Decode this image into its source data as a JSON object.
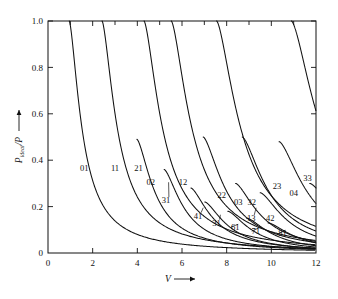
{
  "chart_data": {
    "type": "line",
    "title": "",
    "xlabel": "V",
    "ylabel": "P_ideal/P",
    "xlabel_display": "V",
    "ylabel_main": "P",
    "ylabel_sub": "ideal",
    "ylabel_den": "/P",
    "xlim": [
      0,
      12
    ],
    "ylim": [
      0,
      1.0
    ],
    "grid": false,
    "legend": "none",
    "x_ticks": [
      0,
      2,
      4,
      6,
      8,
      10,
      12
    ],
    "x_tick_labels": [
      "0",
      "2",
      "4",
      "6",
      "8",
      "10",
      "12"
    ],
    "x_minor_ticks": [
      1,
      3,
      5,
      7,
      9,
      11
    ],
    "y_ticks": [
      0,
      0.2,
      0.4,
      0.6,
      0.8,
      1.0
    ],
    "y_tick_labels": [
      "0",
      "0.2",
      "0.4",
      "0.6",
      "0.8",
      "1.0"
    ],
    "arrow_on_x_axis": true,
    "arrow_on_y_axis": true,
    "series": [
      {
        "name": "01",
        "cutoff": 0.0,
        "asymptote": 0.95,
        "label_x": 1.62,
        "label_y": 0.355,
        "leader": false
      },
      {
        "name": "11",
        "cutoff": 1.0,
        "asymptote": 2.42,
        "label_x": 3.0,
        "label_y": 0.355,
        "leader": false
      },
      {
        "name": "21",
        "cutoff": 0.49,
        "asymptote": 3.98,
        "label_x": 4.05,
        "label_y": 0.355,
        "leader": false
      },
      {
        "name": "02",
        "cutoff": 1.0,
        "asymptote": 4.3,
        "label_x": 4.6,
        "label_y": 0.295,
        "leader": false
      },
      {
        "name": "31",
        "cutoff": 0.36,
        "asymptote": 5.2,
        "label_x": 5.28,
        "label_y": 0.215,
        "leader": true,
        "leader_x": 5.4,
        "leader_y": 0.305
      },
      {
        "name": "12",
        "cutoff": 1.0,
        "asymptote": 5.52,
        "label_x": 6.05,
        "label_y": 0.295,
        "leader": false
      },
      {
        "name": "22",
        "cutoff": 0.5,
        "asymptote": 6.95,
        "label_x": 7.78,
        "label_y": 0.235,
        "leader": false
      },
      {
        "name": "03",
        "cutoff": 1.0,
        "asymptote": 7.55,
        "label_x": 8.52,
        "label_y": 0.205,
        "leader": false
      },
      {
        "name": "41",
        "cutoff": 0.28,
        "asymptote": 6.4,
        "label_x": 6.72,
        "label_y": 0.148,
        "leader": true,
        "leader_x": 6.95,
        "leader_y": 0.195
      },
      {
        "name": "31b",
        "cutoff": 0.22,
        "asymptote": 7.02,
        "label_x": 7.55,
        "label_y": 0.118,
        "leader": true,
        "leader_x": 7.72,
        "leader_y": 0.165,
        "display": "31"
      },
      {
        "name": "32",
        "cutoff": 0.5,
        "asymptote": 8.7,
        "label_x": 9.12,
        "label_y": 0.205,
        "leader": false
      },
      {
        "name": "13",
        "cutoff": 0.3,
        "asymptote": 8.4,
        "label_x": 9.1,
        "label_y": 0.138,
        "leader": true,
        "leader_x": 9.32,
        "leader_y": 0.195
      },
      {
        "name": "61",
        "cutoff": 0.18,
        "asymptote": 8.05,
        "label_x": 8.38,
        "label_y": 0.098,
        "leader": true,
        "leader_x": 8.2,
        "leader_y": 0.112
      },
      {
        "name": "23",
        "cutoff": 0.48,
        "asymptote": 10.35,
        "label_x": 10.25,
        "label_y": 0.275,
        "leader": false
      },
      {
        "name": "42",
        "cutoff": 0.26,
        "asymptote": 9.5,
        "label_x": 9.95,
        "label_y": 0.138,
        "leader": false
      },
      {
        "name": "71",
        "cutoff": 0.15,
        "asymptote": 8.9,
        "label_x": 9.3,
        "label_y": 0.082,
        "leader": true,
        "leader_x": 9.12,
        "leader_y": 0.094
      },
      {
        "name": "04",
        "cutoff": 1.0,
        "asymptote": 10.9,
        "label_x": 11.0,
        "label_y": 0.245,
        "leader": false
      },
      {
        "name": "81",
        "cutoff": 0.13,
        "asymptote": 9.85,
        "label_x": 10.5,
        "label_y": 0.072,
        "leader": true,
        "leader_x": 10.3,
        "leader_y": 0.082
      },
      {
        "name": "33",
        "cutoff": 0.3,
        "asymptote": 11.72,
        "label_x": 11.62,
        "label_y": 0.31,
        "leader": false
      }
    ]
  }
}
